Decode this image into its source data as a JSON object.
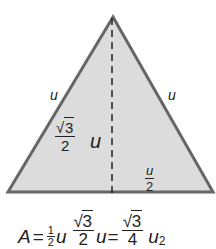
{
  "figure": {
    "shape": "equilateral-triangle",
    "fill_color": "#dcdcdc",
    "stroke_color": "#666666",
    "altitude_style": "dashed",
    "vertices": {
      "apex": [
        113,
        17
      ],
      "base_left": [
        8,
        192
      ],
      "base_right": [
        213,
        192
      ]
    },
    "labels": {
      "left_side": "u",
      "right_side": "u",
      "height_numerator": "3",
      "height_denominator": "2",
      "height_variable": "u",
      "half_base_numerator": "u",
      "half_base_denominator": "2"
    }
  },
  "formula": {
    "lhs": "A",
    "eq1": "=",
    "half_num": "1",
    "half_den": "2",
    "var1": "u",
    "sqrt_num": "3",
    "sqrt_den": "2",
    "var2": "u",
    "eq2": "=",
    "result_num": "3",
    "result_den": "4",
    "var3": "u",
    "power": "2"
  }
}
